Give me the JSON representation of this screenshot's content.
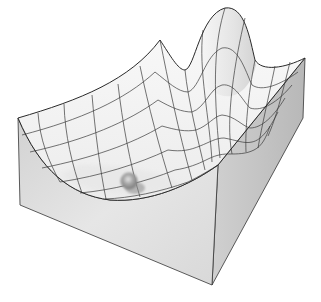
{
  "figure": {
    "description": "3D wireframe potential energy surface with a valley and a peak, cut as a solid block; a ball rests in the lowest part of the valley",
    "elements": [
      "surface-mesh",
      "block-front-face",
      "block-right-face",
      "ball",
      "peak",
      "valley"
    ],
    "colors": {
      "background": "#ffffff",
      "surface": "#f2f2f2",
      "mesh_line": "#3a3a3a",
      "front_face": "#dcdcdc",
      "right_face": "#c4c4c4",
      "ball": "#9a9a9a"
    }
  }
}
